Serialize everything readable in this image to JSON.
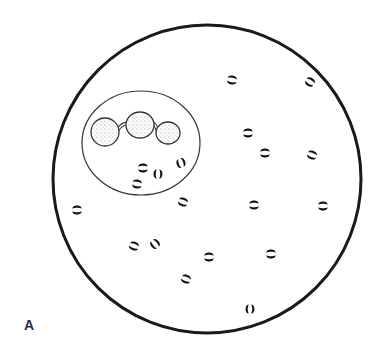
{
  "figure": {
    "panel_label": "A",
    "colors": {
      "background": "#ffffff",
      "field_outline": "#1a1a1a",
      "cell_outline": "#333333",
      "diplococci": "#111118",
      "nucleus_stipple": "#777777"
    },
    "field_circle": {
      "cx": 207,
      "cy": 179,
      "r": 154
    },
    "leukocyte": {
      "cx": 141,
      "cy": 143,
      "rx": 59,
      "ry": 52,
      "nucleus_lobes": [
        {
          "cx": 105,
          "cy": 132,
          "rx": 14,
          "ry": 14
        },
        {
          "cx": 140,
          "cy": 125,
          "rx": 14,
          "ry": 13
        },
        {
          "cx": 168,
          "cy": 133,
          "rx": 12,
          "ry": 11
        }
      ]
    },
    "intracellular_diplococci": [
      {
        "x": 143,
        "y": 168,
        "angle": 0
      },
      {
        "x": 158,
        "y": 174,
        "angle": 90
      },
      {
        "x": 181,
        "y": 163,
        "angle": 70
      },
      {
        "x": 137,
        "y": 184,
        "angle": 10
      }
    ],
    "extracellular_diplococci": [
      {
        "x": 232,
        "y": 80,
        "angle": 10
      },
      {
        "x": 310,
        "y": 82,
        "angle": 30
      },
      {
        "x": 248,
        "y": 133,
        "angle": 0
      },
      {
        "x": 265,
        "y": 153,
        "angle": 0
      },
      {
        "x": 312,
        "y": 155,
        "angle": 20
      },
      {
        "x": 183,
        "y": 202,
        "angle": 20
      },
      {
        "x": 77,
        "y": 210,
        "angle": 0
      },
      {
        "x": 254,
        "y": 205,
        "angle": 0
      },
      {
        "x": 323,
        "y": 206,
        "angle": 0
      },
      {
        "x": 134,
        "y": 246,
        "angle": 20
      },
      {
        "x": 155,
        "y": 244,
        "angle": 50
      },
      {
        "x": 209,
        "y": 257,
        "angle": 0
      },
      {
        "x": 271,
        "y": 254,
        "angle": 0
      },
      {
        "x": 186,
        "y": 279,
        "angle": 20
      },
      {
        "x": 250,
        "y": 309,
        "angle": 90
      }
    ]
  }
}
